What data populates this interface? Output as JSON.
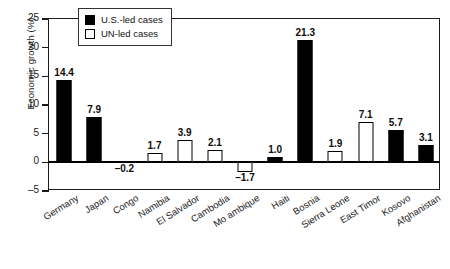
{
  "chart_data": {
    "type": "bar",
    "title": "",
    "xlabel": "",
    "ylabel": "Economic growth (%)",
    "ylim": [
      -5,
      25
    ],
    "yticks": [
      -5,
      0,
      5,
      10,
      15,
      20,
      25
    ],
    "ytick_labels": [
      "–5",
      "0",
      "5",
      "10",
      "15",
      "20",
      "25"
    ],
    "grid": false,
    "legend_position": "top-left-inside",
    "categories": [
      "Germany",
      "Japan",
      "Congo",
      "Namibia",
      "El Salvador",
      "Cambodia",
      "Mo ambique",
      "Haiti",
      "Bosnia",
      "Sierra Leone",
      "East Timor",
      "Kosovo",
      "Afghanistan"
    ],
    "values": [
      14.4,
      7.9,
      -0.2,
      1.7,
      3.9,
      2.1,
      -1.7,
      1.0,
      21.3,
      1.9,
      7.1,
      5.7,
      3.1
    ],
    "value_labels": [
      "14.4",
      "7.9",
      "–0.2",
      "1.7",
      "3.9",
      "2.1",
      "–1.7",
      "1.0",
      "21.3",
      "1.9",
      "7.1",
      "5.7",
      "3.1"
    ],
    "series_of_point": [
      "us",
      "us",
      "us",
      "un",
      "un",
      "un",
      "un",
      "us",
      "us",
      "un",
      "un",
      "us",
      "us"
    ],
    "series": [
      {
        "name": "U.S.-led cases",
        "key": "us",
        "fill": "#000000",
        "stroke": "#000000"
      },
      {
        "name": "UN-led cases",
        "key": "un",
        "fill": "#ffffff",
        "stroke": "#000000"
      }
    ]
  },
  "legend": {
    "items": [
      {
        "label": "U.S.-led cases",
        "key": "us"
      },
      {
        "label": "UN-led cases",
        "key": "un"
      }
    ]
  }
}
